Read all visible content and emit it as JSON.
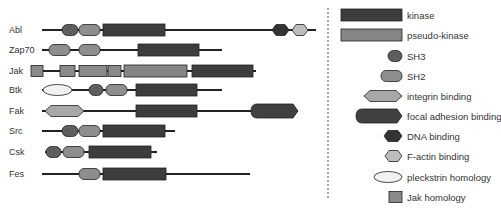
{
  "colors": {
    "kinase": "#3d3d3d",
    "pseudo_kinase": "#858585",
    "SH3": "#5e5e5e",
    "SH2": "#8e8e8e",
    "integrin_binding": "#a8a8a8",
    "focal_adhesion_binding": "#404040",
    "DNA_binding": "#333333",
    "F_actin_binding": "#bdbdbd",
    "pleckstrin_homology": "#f2f2f2",
    "jak_homology": "#8a8a8a"
  },
  "proteins": [
    {
      "name": "Abl",
      "line": [
        42,
        316
      ],
      "domains": [
        {
          "type": "SH3",
          "start": 62,
          "end": 78
        },
        {
          "type": "SH2",
          "start": 79,
          "end": 100
        },
        {
          "type": "kinase",
          "start": 103,
          "end": 165
        },
        {
          "type": "DNA_binding",
          "start": 272,
          "end": 289
        },
        {
          "type": "F_actin_binding",
          "start": 292,
          "end": 308
        }
      ]
    },
    {
      "name": "Zap70",
      "line": [
        42,
        222
      ],
      "domains": [
        {
          "type": "SH2",
          "start": 49,
          "end": 70
        },
        {
          "type": "SH2",
          "start": 79,
          "end": 100
        },
        {
          "type": "kinase",
          "start": 138,
          "end": 199
        }
      ]
    },
    {
      "name": "Jak",
      "line": [
        31,
        256
      ],
      "domains": [
        {
          "type": "jak_homology",
          "start": 31,
          "end": 43
        },
        {
          "type": "jak_homology",
          "start": 60,
          "end": 75
        },
        {
          "type": "jak_homology",
          "start": 79,
          "end": 107
        },
        {
          "type": "jak_homology",
          "start": 108,
          "end": 121
        },
        {
          "type": "pseudo_kinase",
          "start": 124,
          "end": 187
        },
        {
          "type": "kinase",
          "start": 192,
          "end": 253
        }
      ]
    },
    {
      "name": "Btk",
      "line": [
        42,
        222
      ],
      "domains": [
        {
          "type": "pleckstrin_homology",
          "start": 43,
          "end": 72
        },
        {
          "type": "SH3",
          "start": 89,
          "end": 103
        },
        {
          "type": "SH2",
          "start": 106,
          "end": 127
        },
        {
          "type": "kinase",
          "start": 136,
          "end": 197
        }
      ]
    },
    {
      "name": "Fak",
      "line": [
        42,
        298
      ],
      "domains": [
        {
          "type": "integrin_binding",
          "start": 45,
          "end": 84
        },
        {
          "type": "kinase",
          "start": 136,
          "end": 197
        },
        {
          "type": "focal_adhesion_binding",
          "start": 251,
          "end": 298
        }
      ]
    },
    {
      "name": "Src",
      "line": [
        42,
        175
      ],
      "domains": [
        {
          "type": "SH3",
          "start": 62,
          "end": 78
        },
        {
          "type": "SH2",
          "start": 79,
          "end": 100
        },
        {
          "type": "kinase",
          "start": 103,
          "end": 165
        }
      ]
    },
    {
      "name": "Csk",
      "line": [
        45,
        157
      ],
      "domains": [
        {
          "type": "SH3",
          "start": 46,
          "end": 61
        },
        {
          "type": "SH2",
          "start": 63,
          "end": 84
        },
        {
          "type": "kinase",
          "start": 89,
          "end": 151
        }
      ]
    },
    {
      "name": "Fes",
      "line": [
        42,
        250
      ],
      "domains": [
        {
          "type": "SH2",
          "start": 79,
          "end": 100
        },
        {
          "type": "kinase",
          "start": 103,
          "end": 166
        }
      ]
    }
  ],
  "legend": [
    {
      "type": "kinase",
      "label": "kinase"
    },
    {
      "type": "pseudo_kinase",
      "label": "pseudo-kinase"
    },
    {
      "type": "SH3",
      "label": "SH3"
    },
    {
      "type": "SH2",
      "label": "SH2"
    },
    {
      "type": "integrin_binding",
      "label": "integrin binding"
    },
    {
      "type": "focal_adhesion_binding",
      "label": "focal adhesion binding"
    },
    {
      "type": "DNA_binding",
      "label": "DNA binding"
    },
    {
      "type": "F_actin_binding",
      "label": "F-actin binding"
    },
    {
      "type": "pleckstrin_homology",
      "label": "pleckstrin homology"
    },
    {
      "type": "jak_homology",
      "label": "Jak homology"
    }
  ]
}
